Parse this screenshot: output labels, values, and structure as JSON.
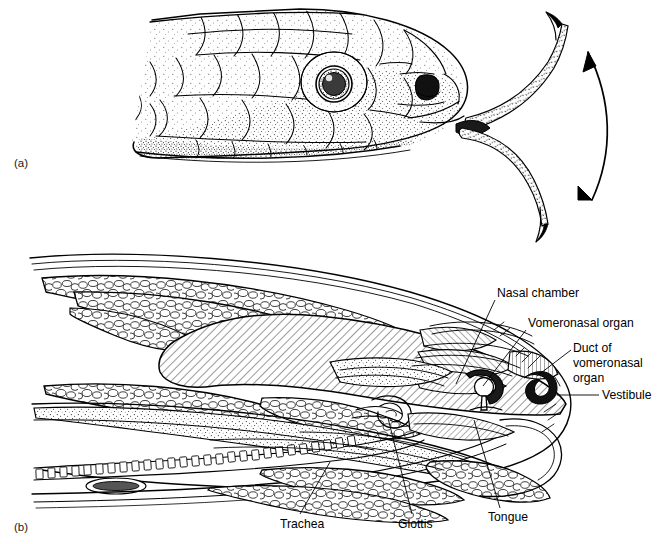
{
  "figure": {
    "background_color": "#ffffff",
    "ink_color": "#000000",
    "width": 662,
    "height": 544
  },
  "panels": [
    {
      "tag": "(a)",
      "name": "snake-head-tongue-flick",
      "description": "Lateral view of a snake head with forked tongue extended and a double-headed arrow indicating tongue-flick motion"
    },
    {
      "tag": "(b)",
      "name": "sagittal-section",
      "description": "Sagittal section through the snake head showing nasal and vomeronasal structures"
    }
  ],
  "annotations": [
    {
      "id": "nasal-chamber",
      "label": "Nasal chamber",
      "lines": [
        "Nasal chamber"
      ],
      "text_x": 497,
      "text_y": 297,
      "anchor": "start",
      "leader": "M 495 300 L 456 384"
    },
    {
      "id": "vomeronasal-organ",
      "label": "Vomeronasal organ",
      "lines": [
        "Vomeronasal organ"
      ],
      "text_x": 528,
      "text_y": 327,
      "anchor": "start",
      "leader": "M 526 330 L 483 386"
    },
    {
      "id": "duct-of-vomeronasal-organ",
      "label": "Duct of vomeronasal organ",
      "lines": [
        "Duct of",
        "vomeronasal",
        "organ"
      ],
      "text_x": 573,
      "text_y": 352,
      "anchor": "start",
      "leader": "M 571 350 L 537 376"
    },
    {
      "id": "vestibule",
      "label": "Vestibule",
      "lines": [
        "Vestibule"
      ],
      "text_x": 602,
      "text_y": 399,
      "anchor": "start",
      "leader": "M 599 395 L 557 395"
    },
    {
      "id": "trachea",
      "label": "Trachea",
      "lines": [
        "Trachea"
      ],
      "text_x": 280,
      "text_y": 528,
      "anchor": "start",
      "leader": "M 300 514 L 330 462"
    },
    {
      "id": "glottis",
      "label": "Glottis",
      "lines": [
        "Glottis"
      ],
      "text_x": 398,
      "text_y": 528,
      "anchor": "start",
      "leader": "M 412 514 L 388 418"
    },
    {
      "id": "tongue",
      "label": "Tongue",
      "lines": [
        "Tongue"
      ],
      "text_x": 488,
      "text_y": 521,
      "anchor": "start",
      "leader": "M 500 508 L 474 420"
    }
  ],
  "motion_arrow": {
    "name": "tongue-flick-arrow",
    "description": "Double-headed curved arrow beside the tongue indicating up-down flicking"
  }
}
